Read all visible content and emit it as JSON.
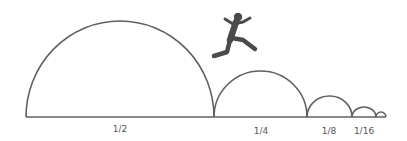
{
  "diagram": {
    "colors": {
      "stroke": "#606060",
      "figure": "#4a4a4a",
      "label": "#555555",
      "background": "#ffffff"
    },
    "baseline": {
      "x1": 26,
      "x2": 386,
      "y": 117
    },
    "arcs": [
      {
        "fraction": "1/2",
        "x1": 26,
        "x2": 214,
        "peak_y": 21
      },
      {
        "fraction": "1/4",
        "x1": 214,
        "x2": 307,
        "peak_y": 71
      },
      {
        "fraction": "1/8",
        "x1": 307,
        "x2": 352,
        "peak_y": 96
      },
      {
        "fraction": "1/16",
        "x1": 352,
        "x2": 376,
        "peak_y": 107
      },
      {
        "fraction": "1/32",
        "x1": 376,
        "x2": 386,
        "peak_y": 112
      }
    ],
    "labels": [
      {
        "text": "1/2",
        "x": 120,
        "y": 132
      },
      {
        "text": "1/4",
        "x": 261,
        "y": 134
      },
      {
        "text": "1/8",
        "x": 329,
        "y": 134
      },
      {
        "text": "1/16",
        "x": 364,
        "y": 134
      }
    ],
    "figure": {
      "name": "jumping person",
      "icon": "running-person-icon"
    }
  }
}
